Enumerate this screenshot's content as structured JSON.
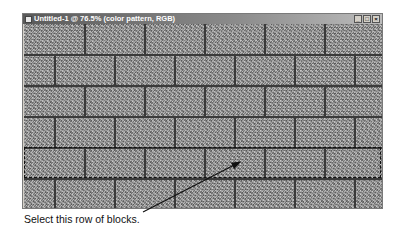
{
  "window": {
    "title": "Untitled-1 @ 76.5% (color pattern, RGB)",
    "controls": {
      "minimize": "_",
      "maximize": "□",
      "close": "×"
    }
  },
  "canvas": {
    "pattern": "brick-wall",
    "fill_color": "#9a9a9a",
    "mortar_color": "#3a3a3a",
    "rows": 6,
    "selected_row": 5
  },
  "annotation": {
    "caption": "Select this row of blocks.",
    "arrow": {
      "from": [
        143,
        212
      ],
      "to": [
        241,
        162
      ]
    }
  }
}
